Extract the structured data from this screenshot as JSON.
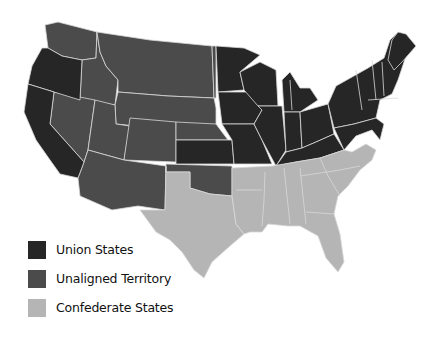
{
  "map": {
    "title": "",
    "colors": {
      "union": "#262626",
      "unaligned": "#4b4b4b",
      "confederate": "#b5b5b5",
      "border": "#d8d8d8",
      "background": "#ffffff"
    }
  },
  "legend": {
    "items": [
      {
        "key": "union",
        "label": "Union States",
        "color": "#262626"
      },
      {
        "key": "unaligned",
        "label": "Unaligned Territory",
        "color": "#4b4b4b"
      },
      {
        "key": "confederate",
        "label": "Confederate States",
        "color": "#b5b5b5"
      }
    ]
  }
}
